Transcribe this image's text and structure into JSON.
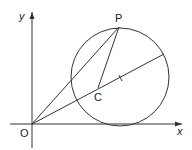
{
  "diagram": {
    "colors": {
      "stroke": "#333333",
      "background": "#ffffff"
    },
    "axes": {
      "x_label": "x",
      "y_label": "y",
      "origin_label": "O"
    },
    "points": {
      "P": {
        "label": "P"
      },
      "C": {
        "label": "C"
      }
    },
    "circle": {
      "center_px": [
        120,
        77
      ],
      "radius_px": 49
    },
    "segments": [
      "OP",
      "CP",
      "O-through-C-chord"
    ]
  }
}
